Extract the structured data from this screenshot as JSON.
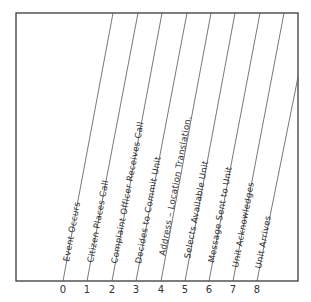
{
  "diagram": {
    "type": "timeline-event-sequence",
    "frame": {
      "left": 16,
      "top": 13,
      "right": 298,
      "bottom": 281
    },
    "line_color": "#555555",
    "frame_color": "#3a3a3a",
    "text_color": "#333333",
    "axis": {
      "ticks": [
        "0",
        "1",
        "2",
        "3",
        "4",
        "5",
        "6",
        "7",
        "8"
      ]
    },
    "events": [
      {
        "index": "0",
        "label": "Event Occurs"
      },
      {
        "index": "1",
        "label": "Citizen Places Call"
      },
      {
        "index": "2",
        "label": "Complaint Officer Receives Call"
      },
      {
        "index": "3",
        "label": "Decides to Commit Unit"
      },
      {
        "index": "4",
        "label": "Address – Location Translation."
      },
      {
        "index": "5",
        "label": "Selects Available Unit"
      },
      {
        "index": "6",
        "label": "Message Sent to Unit"
      },
      {
        "index": "7",
        "label": "Unit Acknowledges"
      },
      {
        "index": "8",
        "label": "Unit Arrives"
      }
    ]
  }
}
